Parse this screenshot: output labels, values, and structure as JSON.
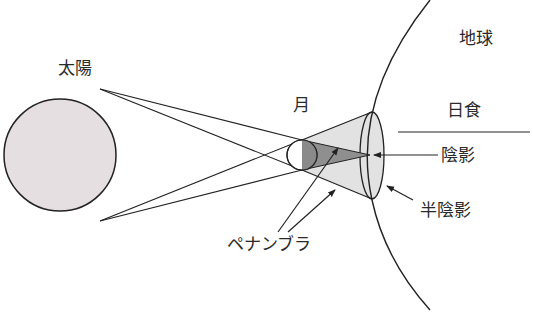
{
  "labels": {
    "sun": "太陽",
    "moon": "月",
    "earth": "地球",
    "solar_eclipse": "日食",
    "umbra": "陰影",
    "penumbra": "半陰影",
    "penumbra_katakana": "ペナンブラ"
  },
  "colors": {
    "sun_fill": "#e6dfe2",
    "stroke": "#222222",
    "penumbra_fill": "#e2e2e2",
    "umbra_fill": "#8f8f8f",
    "moon_dark": "#8a8a8a",
    "text": "#2a2a2a"
  }
}
